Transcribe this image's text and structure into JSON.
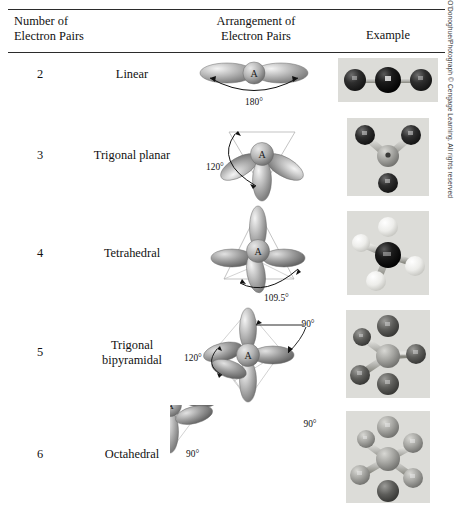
{
  "table": {
    "crop_remnant": "",
    "headers": {
      "col1_line1": "Number of",
      "col1_line2": "Electron Pairs",
      "col2_line1": "Arrangement of",
      "col2_line2": "Electron Pairs",
      "col3": "Example"
    },
    "rows": [
      {
        "pairs": "2",
        "name": "Linear",
        "name_line2": "",
        "angles": [
          "180°"
        ],
        "central_label": "A",
        "geometry": "linear",
        "photo": {
          "model": "linear-ball-and-stick",
          "center_color": "#0d0d0d",
          "terminal_color": "#3b3b3b",
          "background": "#dcdcd8"
        }
      },
      {
        "pairs": "3",
        "name": "Trigonal planar",
        "name_line2": "",
        "angles": [
          "120°"
        ],
        "central_label": "A",
        "geometry": "trigonal-planar",
        "photo": {
          "model": "trigonal-planar-ball-and-stick",
          "center_color": "#b6b6b2",
          "terminal_color": "#171717",
          "background": "#dcdcd8"
        }
      },
      {
        "pairs": "4",
        "name": "Tetrahedral",
        "name_line2": "",
        "angles": [
          "109.5°"
        ],
        "central_label": "A",
        "geometry": "tetrahedral",
        "photo": {
          "model": "tetrahedral-ball-and-stick",
          "center_color": "#0a0a0a",
          "terminal_color": "#f2f2ee",
          "background": "#dcdcd8"
        }
      },
      {
        "pairs": "5",
        "name": "Trigonal",
        "name_line2": "bipyramidal",
        "angles": [
          "90°",
          "120°"
        ],
        "central_label": "A",
        "geometry": "trigonal-bipyramidal",
        "photo": {
          "model": "trigonal-bipyramidal-ball-and-stick",
          "center_color": "#b0b0ac",
          "terminal_color": "#5a5a58",
          "background": "#dcdcd8"
        }
      },
      {
        "pairs": "6",
        "name": "Octahedral",
        "name_line2": "",
        "angles": [
          "90°",
          "90°"
        ],
        "central_label": "A",
        "geometry": "octahedral",
        "photo": {
          "model": "octahedral-ball-and-stick",
          "center_color": "#b0b0ac",
          "terminal_color": "#9a9a96",
          "background": "#dcdcd8"
        }
      }
    ],
    "credit": "Photos Ken O'Donoghue/Photograph © Cengage Learning. All rights reserved"
  }
}
